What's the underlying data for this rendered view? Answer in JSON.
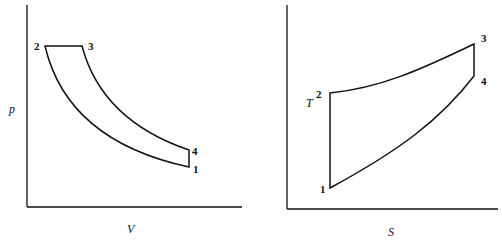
{
  "diagrams": [
    {
      "name": "pv-diagram",
      "x_axis_label": "V",
      "y_axis_label": "p",
      "points": [
        {
          "id": "1",
          "label": "1"
        },
        {
          "id": "2",
          "label": "2"
        },
        {
          "id": "3",
          "label": "3"
        },
        {
          "id": "4",
          "label": "4"
        }
      ],
      "processes": [
        {
          "from": "1",
          "to": "2",
          "shape": "curve"
        },
        {
          "from": "2",
          "to": "3",
          "shape": "horizontal line (constant pressure)"
        },
        {
          "from": "3",
          "to": "4",
          "shape": "curve"
        },
        {
          "from": "4",
          "to": "1",
          "shape": "vertical line (constant volume)"
        }
      ]
    },
    {
      "name": "ts-diagram",
      "x_axis_label": "S",
      "y_axis_label": "T",
      "points": [
        {
          "id": "1",
          "label": "1"
        },
        {
          "id": "2",
          "label": "2"
        },
        {
          "id": "3",
          "label": "3"
        },
        {
          "id": "4",
          "label": "4"
        }
      ],
      "processes": [
        {
          "from": "1",
          "to": "2",
          "shape": "vertical line (isentropic)"
        },
        {
          "from": "2",
          "to": "3",
          "shape": "curve"
        },
        {
          "from": "3",
          "to": "4",
          "shape": "vertical line (isentropic)"
        },
        {
          "from": "4",
          "to": "1",
          "shape": "curve"
        }
      ]
    }
  ]
}
